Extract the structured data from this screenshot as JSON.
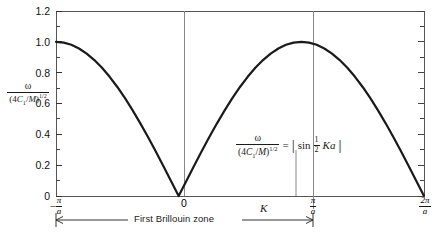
{
  "figure": {
    "background": "#ffffff",
    "frame_color": "#4d4d4d",
    "curve_color": "#1a1a1a",
    "text_color": "#1a1a1a"
  },
  "axes": {
    "y_label_numerator": "ω",
    "y_label_denominator_prefix": "(4",
    "y_label_denominator_C": "C",
    "y_label_denominator_sub": "1",
    "y_label_denominator_mid": "/",
    "y_label_denominator_M": "M",
    "y_label_denominator_close": ")",
    "y_label_exponent": "1/2",
    "x_label": "K",
    "y_ticks": [
      "0",
      "0.2",
      "0.4",
      "0.6",
      "0.8",
      "1.0",
      "1.2"
    ],
    "x_ticks": [
      {
        "label_minus": "−",
        "num": "π",
        "den": "a",
        "plain": ""
      },
      {
        "label_minus": "",
        "num": "",
        "den": "",
        "plain": "0"
      },
      {
        "label_minus": "",
        "num": "π",
        "den": "a",
        "plain": ""
      },
      {
        "label_minus": "",
        "num": "2π",
        "den": "a",
        "plain": ""
      }
    ]
  },
  "annotation": {
    "equation_numerator": "ω",
    "equation_den_prefix": "(4",
    "equation_den_C": "C",
    "equation_den_sub": "1",
    "equation_den_mid": "/",
    "equation_den_M": "M",
    "equation_den_close": ")",
    "equation_exponent": "1/2",
    "equals": "=",
    "abs_open": "|",
    "sin": "sin",
    "half_num": "1",
    "half_den": "2",
    "Ka": "Ka",
    "abs_close": "|"
  },
  "zone": {
    "label": "First Brillouin zone"
  },
  "chart_data": {
    "type": "line",
    "title": "",
    "xlabel": "K",
    "ylabel": "ω/(4C₁/M)^(1/2)",
    "equation": "ω/(4C₁/M)^(1/2) = |sin ½ Ka|",
    "xlim": [
      -3.14159,
      6.28319
    ],
    "ylim": [
      0,
      1.2
    ],
    "x_tick_values": [
      -3.14159,
      0,
      3.14159,
      6.28319
    ],
    "x_tick_labels": [
      "-π/a",
      "0",
      "π/a",
      "2π/a"
    ],
    "y_tick_values": [
      0,
      0.2,
      0.4,
      0.6,
      0.8,
      1.0,
      1.2
    ],
    "y_tick_labels": [
      "0",
      "0.2",
      "0.4",
      "0.6",
      "0.8",
      "1.0",
      "1.2"
    ],
    "grid": false,
    "legend": null,
    "series": [
      {
        "name": "|sin(Ka/2)|",
        "x": [
          -3.14159,
          -2.9452,
          -2.74889,
          -2.55254,
          -2.35619,
          -2.15984,
          -1.9635,
          -1.76715,
          -1.5708,
          -1.37445,
          -1.1781,
          -0.98175,
          -0.7854,
          -0.58905,
          -0.3927,
          -0.19635,
          0,
          0.19635,
          0.3927,
          0.58905,
          0.7854,
          0.98175,
          1.1781,
          1.37445,
          1.5708,
          1.76715,
          1.9635,
          2.15984,
          2.35619,
          2.55254,
          2.74889,
          2.94524,
          3.14159,
          3.33794,
          3.53429,
          3.73064,
          3.92699,
          4.12334,
          4.31969,
          4.51604,
          4.71239,
          4.90874,
          5.10509,
          5.30144,
          5.49779,
          5.69414,
          5.89049,
          6.08684,
          6.28319
        ],
        "y": [
          1.0,
          0.99518,
          0.98079,
          0.95694,
          0.92388,
          0.88192,
          0.83147,
          0.77301,
          0.70711,
          0.63439,
          0.55557,
          0.4714,
          0.38268,
          0.29028,
          0.19509,
          0.09802,
          0.0,
          0.09802,
          0.19509,
          0.29028,
          0.38268,
          0.4714,
          0.55557,
          0.63439,
          0.70711,
          0.77301,
          0.83147,
          0.88192,
          0.92388,
          0.95694,
          0.98079,
          0.99518,
          1.0,
          0.99518,
          0.98079,
          0.95694,
          0.92388,
          0.88192,
          0.83147,
          0.77301,
          0.70711,
          0.63439,
          0.55557,
          0.4714,
          0.38268,
          0.29028,
          0.19509,
          0.09802,
          0.0
        ]
      }
    ],
    "annotations": [
      {
        "text": "First Brillouin zone",
        "x_from": -3.14159,
        "x_to": 3.14159,
        "type": "span-arrow"
      },
      {
        "text": "ω/(4C₁/M)^(1/2) = |sin ½ Ka|",
        "x": 2.2,
        "y": 0.33,
        "type": "equation"
      }
    ]
  }
}
